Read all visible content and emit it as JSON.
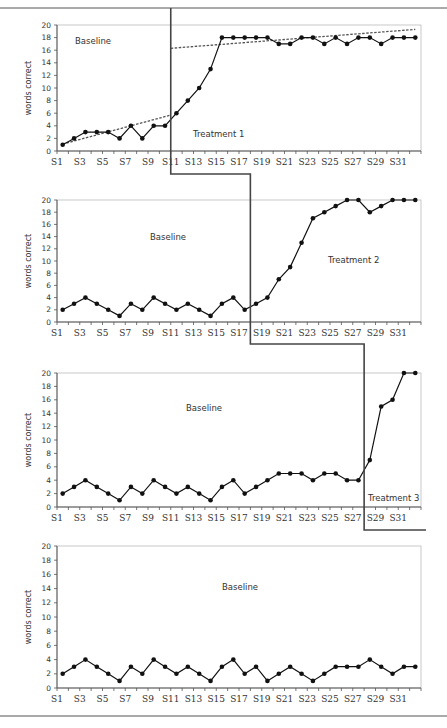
{
  "chart_data": {
    "type": "line",
    "title": "",
    "x": [
      "S1",
      "S2",
      "S3",
      "S4",
      "S5",
      "S6",
      "S7",
      "S8",
      "S9",
      "S10",
      "S11",
      "S12",
      "S13",
      "S14",
      "S15",
      "S16",
      "S17",
      "S18",
      "S19",
      "S20",
      "S21",
      "S22",
      "S23",
      "S24",
      "S25",
      "S26",
      "S27",
      "S28",
      "S29",
      "S30",
      "S31",
      "S32"
    ],
    "x_tick_labels": [
      "S1",
      "S3",
      "S5",
      "S7",
      "S9",
      "S11",
      "S13",
      "S15",
      "S17",
      "S19",
      "S21",
      "S23",
      "S25",
      "S27",
      "S29",
      "S31"
    ],
    "ylabel": "words correct",
    "ylim": [
      0,
      20
    ],
    "y_ticks": [
      0,
      2,
      4,
      6,
      8,
      10,
      12,
      14,
      16,
      18,
      20
    ],
    "grid": false,
    "panels": [
      {
        "name": "panel-1",
        "baseline_label": "Baseline",
        "treatment_label": "Treatment 1",
        "phase_change_after": 10,
        "values": [
          1,
          2,
          3,
          3,
          3,
          2,
          4,
          2,
          4,
          4,
          6,
          8,
          10,
          13,
          18,
          18,
          18,
          18,
          18,
          17,
          17,
          18,
          18,
          17,
          18,
          17,
          18,
          18,
          17,
          18,
          18,
          18
        ],
        "trend_lines": [
          {
            "name": "baseline-trend",
            "from": [
              1,
              1.1
            ],
            "to": [
              10.5,
              5.7
            ]
          },
          {
            "name": "treatment-trend",
            "from": [
              10.5,
              16.3
            ],
            "to": [
              32,
              19.3
            ]
          }
        ]
      },
      {
        "name": "panel-2",
        "baseline_label": "Baseline",
        "treatment_label": "Treatment 2",
        "phase_change_after": 17,
        "values": [
          2,
          3,
          4,
          3,
          2,
          1,
          3,
          2,
          4,
          3,
          2,
          3,
          2,
          1,
          3,
          4,
          2,
          3,
          4,
          7,
          9,
          13,
          17,
          18,
          19,
          20,
          20,
          18,
          19,
          20,
          20,
          20
        ]
      },
      {
        "name": "panel-3",
        "baseline_label": "Baseline",
        "treatment_label": "Treatment 3",
        "phase_change_after": 27,
        "values": [
          2,
          3,
          4,
          3,
          2,
          1,
          3,
          2,
          4,
          3,
          2,
          3,
          2,
          1,
          3,
          4,
          2,
          3,
          4,
          5,
          5,
          5,
          4,
          5,
          5,
          4,
          4,
          7,
          15,
          16,
          20,
          20
        ]
      },
      {
        "name": "panel-4",
        "baseline_label": "Baseline",
        "treatment_label": "",
        "phase_change_after": null,
        "values": [
          2,
          3,
          4,
          3,
          2,
          1,
          3,
          2,
          4,
          3,
          2,
          3,
          2,
          1,
          3,
          4,
          2,
          3,
          1,
          2,
          3,
          2,
          1,
          2,
          3,
          3,
          3,
          4,
          3,
          2,
          3,
          3
        ]
      }
    ]
  },
  "colors": {
    "series": "#111111",
    "axis": "#555555",
    "frame": "#bbbbbb",
    "phase_line": "#444444"
  }
}
